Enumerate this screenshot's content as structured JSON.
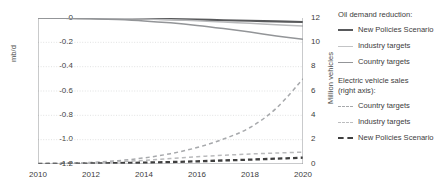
{
  "chart_data": {
    "type": "line",
    "title": "",
    "xlabel": "",
    "x": [
      2010,
      2011,
      2012,
      2013,
      2014,
      2015,
      2016,
      2017,
      2018,
      2019,
      2020
    ],
    "xlim": [
      2010,
      2020
    ],
    "xticks": [
      "2010",
      "2012",
      "2014",
      "2016",
      "2018",
      "2020"
    ],
    "xtick_values": [
      2010,
      2012,
      2014,
      2016,
      2018,
      2020
    ],
    "grid": true,
    "legend_position": "right",
    "axes": [
      {
        "id": "left",
        "ylabel": "mb/d",
        "ylim": [
          -1.2,
          0
        ],
        "yticks": [
          "0",
          "-0.2",
          "-0.4",
          "-0.6",
          "-0.8",
          "-1.0",
          "-1.2"
        ],
        "ytick_values": [
          0,
          -0.2,
          -0.4,
          -0.6,
          -0.8,
          -1.0,
          -1.2
        ]
      },
      {
        "id": "right",
        "ylabel": "Million vehicles",
        "ylim": [
          0,
          12
        ],
        "yticks": [
          "12",
          "10",
          "8",
          "6",
          "4",
          "2",
          "0"
        ],
        "ytick_values": [
          12,
          10,
          8,
          6,
          4,
          2,
          0
        ]
      }
    ],
    "series": [
      {
        "name": "New Policies Scenario",
        "group": "Oil demand reduction",
        "axis": "left",
        "unit": "mb/d",
        "style": "solid",
        "color": "#58595b",
        "values": [
          0,
          0,
          -0.002,
          -0.004,
          -0.006,
          -0.009,
          -0.013,
          -0.018,
          -0.023,
          -0.028,
          -0.033
        ]
      },
      {
        "name": "Industry targets",
        "group": "Oil demand reduction",
        "axis": "left",
        "unit": "mb/d",
        "style": "solid",
        "color": "#b9babc",
        "values": [
          0,
          0,
          -0.002,
          -0.005,
          -0.009,
          -0.015,
          -0.023,
          -0.033,
          -0.044,
          -0.055,
          -0.065
        ]
      },
      {
        "name": "Country targets",
        "group": "Oil demand reduction",
        "axis": "left",
        "unit": "mb/d",
        "style": "solid",
        "color": "#939598",
        "values": [
          0,
          -0.002,
          -0.006,
          -0.013,
          -0.024,
          -0.04,
          -0.061,
          -0.087,
          -0.116,
          -0.147,
          -0.175
        ]
      },
      {
        "name": "Country targets",
        "group": "Electric vehicle sales",
        "axis": "right",
        "unit": "Million vehicles",
        "style": "dashed",
        "color": "#a7a9ac",
        "values": [
          0.02,
          0.06,
          0.13,
          0.27,
          0.5,
          0.85,
          1.35,
          2.05,
          3.0,
          4.6,
          7.0
        ]
      },
      {
        "name": "Industry targets",
        "group": "Electric vehicle sales",
        "axis": "right",
        "unit": "Million vehicles",
        "style": "dashed",
        "color": "#b9babc",
        "values": [
          0.02,
          0.05,
          0.1,
          0.18,
          0.3,
          0.45,
          0.6,
          0.72,
          0.82,
          0.9,
          0.98
        ]
      },
      {
        "name": "New Policies Scenario",
        "group": "Electric vehicle sales",
        "axis": "right",
        "unit": "Million vehicles",
        "style": "dashed",
        "color": "#3f3f3f",
        "values": [
          0.01,
          0.02,
          0.04,
          0.07,
          0.11,
          0.16,
          0.22,
          0.29,
          0.36,
          0.44,
          0.52
        ]
      }
    ]
  },
  "axis_titles": {
    "left": "mb/d",
    "right": "Million vehicles"
  },
  "ticks": {
    "left": [
      "0",
      "-0.2",
      "-0.4",
      "-0.6",
      "-0.8",
      "-1.0",
      "-1.2"
    ],
    "right": [
      "12",
      "10",
      "8",
      "6",
      "4",
      "2",
      "0"
    ],
    "x": [
      "2010",
      "2012",
      "2014",
      "2016",
      "2018",
      "2020"
    ]
  },
  "legend": {
    "group1_title": "Oil demand reduction:",
    "group1": [
      {
        "label": "New Policies Scenario",
        "color": "#58595b",
        "style": "solid"
      },
      {
        "label": "Industry targets",
        "color": "#c3c4c6",
        "style": "solid"
      },
      {
        "label": "Country targets",
        "color": "#939598",
        "style": "solid"
      }
    ],
    "group2_title_line1": "Electric vehicle sales",
    "group2_title_line2": "(right axis):",
    "group2": [
      {
        "label": "Country targets",
        "color": "#a7a9ac",
        "style": "dashed"
      },
      {
        "label": "Industry targets",
        "color": "#bcbdbf",
        "style": "dashed"
      },
      {
        "label": "New Policies Scenario",
        "color": "#3f3f3f",
        "style": "dashed"
      }
    ]
  },
  "colors": {
    "axis": "#939598",
    "grid": "#d9dadb",
    "text": "#3c3c3c"
  }
}
